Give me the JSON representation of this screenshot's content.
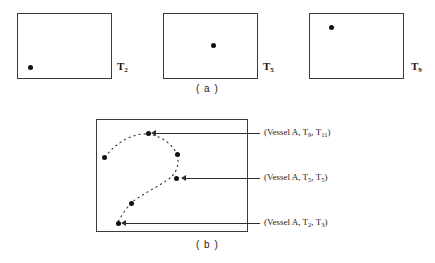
{
  "figure": {
    "panel_a": {
      "caption": "( a )",
      "frames": [
        {
          "label_text": "T",
          "label_sub": "2",
          "dot_x_pct": 13,
          "dot_y_pct": 82
        },
        {
          "label_text": "T",
          "label_sub": "5",
          "dot_x_pct": 52,
          "dot_y_pct": 48
        },
        {
          "label_text": "T",
          "label_sub": "9",
          "dot_x_pct": 22,
          "dot_y_pct": 20
        }
      ]
    },
    "panel_b": {
      "caption": "( b )",
      "annotations": [
        {
          "prefix": "(Vessel A, T",
          "sub1": "9",
          "mid": ", T",
          "sub2": "11",
          "suffix": ")"
        },
        {
          "prefix": "(Vessel A, T",
          "sub1": "5",
          "mid": ", T",
          "sub2": "5",
          "suffix": ")"
        },
        {
          "prefix": "(Vessel A, T",
          "sub1": "2",
          "mid": ", T",
          "sub2": "3",
          "suffix": ")"
        }
      ]
    }
  },
  "colors": {
    "stroke": "#3a3a3a",
    "dot": "#101010",
    "text": "#1a1a1a",
    "background": "#ffffff"
  }
}
